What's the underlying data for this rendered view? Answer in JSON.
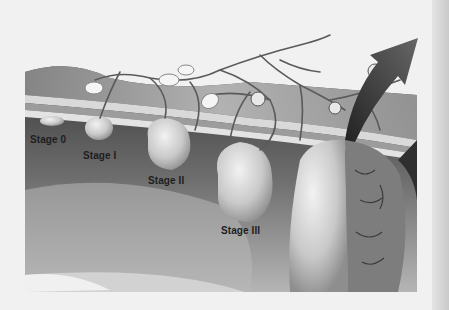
{
  "figure": {
    "labels": [
      {
        "id": "stage-0",
        "text": "Stage 0"
      },
      {
        "id": "stage-1",
        "text": "Stage I"
      },
      {
        "id": "stage-2",
        "text": "Stage II"
      },
      {
        "id": "stage-3",
        "text": "Stage III"
      }
    ],
    "colors": {
      "background": "#f1f1f1",
      "tissue_dark": "#4a4a4a",
      "tissue_mid": "#8a8a8a",
      "tumor_light": "#d8d8d8",
      "vessel": "#5a5a5a",
      "arrow": "#3a3a3a"
    }
  }
}
